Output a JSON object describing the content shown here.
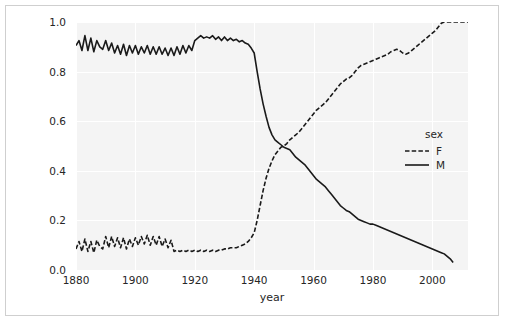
{
  "chart_data": {
    "type": "line",
    "title": "",
    "xlabel": "year",
    "ylabel": "",
    "xlim": [
      1880,
      2012
    ],
    "ylim": [
      0.0,
      1.0
    ],
    "grid": true,
    "legend_title": "sex",
    "legend_position": "right",
    "xticks": [
      1880,
      1900,
      1920,
      1940,
      1960,
      1980,
      2000
    ],
    "xtick_labels": [
      "1880",
      "1900",
      "1920",
      "1940",
      "1960",
      "1980",
      "2000"
    ],
    "yticks": [
      0.0,
      0.2,
      0.4,
      0.6,
      0.8,
      1.0
    ],
    "ytick_labels": [
      "0.0",
      "0.2",
      "0.4",
      "0.6",
      "0.8",
      "1.0"
    ],
    "series": [
      {
        "name": "F",
        "linestyle": "dashed",
        "color": "#1a1a1a",
        "x": [
          1880,
          1881,
          1882,
          1883,
          1884,
          1885,
          1886,
          1887,
          1888,
          1889,
          1890,
          1891,
          1892,
          1893,
          1894,
          1895,
          1896,
          1897,
          1898,
          1899,
          1900,
          1901,
          1902,
          1903,
          1904,
          1905,
          1906,
          1907,
          1908,
          1909,
          1910,
          1911,
          1912,
          1913,
          1914,
          1915,
          1916,
          1917,
          1918,
          1919,
          1920,
          1921,
          1922,
          1923,
          1924,
          1925,
          1926,
          1927,
          1928,
          1929,
          1930,
          1931,
          1932,
          1933,
          1934,
          1935,
          1936,
          1937,
          1938,
          1939,
          1940,
          1941,
          1942,
          1943,
          1944,
          1945,
          1946,
          1947,
          1948,
          1949,
          1950,
          1951,
          1952,
          1953,
          1954,
          1955,
          1956,
          1957,
          1958,
          1959,
          1960,
          1961,
          1962,
          1963,
          1964,
          1965,
          1966,
          1967,
          1968,
          1969,
          1970,
          1971,
          1972,
          1973,
          1974,
          1975,
          1976,
          1977,
          1978,
          1979,
          1980,
          1981,
          1982,
          1983,
          1984,
          1985,
          1986,
          1987,
          1988,
          1989,
          1990,
          1991,
          1992,
          1993,
          1994,
          1995,
          1996,
          1997,
          1998,
          1999,
          2000,
          2001,
          2002,
          2003,
          2004,
          2005,
          2006,
          2007,
          2008,
          2009,
          2010,
          2011,
          2012
        ],
        "values": [
          0.085,
          0.115,
          0.075,
          0.125,
          0.075,
          0.115,
          0.07,
          0.12,
          0.095,
          0.085,
          0.135,
          0.09,
          0.135,
          0.095,
          0.13,
          0.09,
          0.13,
          0.085,
          0.125,
          0.095,
          0.13,
          0.1,
          0.135,
          0.105,
          0.14,
          0.1,
          0.135,
          0.1,
          0.135,
          0.095,
          0.125,
          0.09,
          0.12,
          0.075,
          0.08,
          0.075,
          0.08,
          0.075,
          0.08,
          0.075,
          0.08,
          0.075,
          0.08,
          0.075,
          0.08,
          0.075,
          0.08,
          0.075,
          0.08,
          0.08,
          0.085,
          0.085,
          0.09,
          0.09,
          0.09,
          0.095,
          0.1,
          0.105,
          0.115,
          0.13,
          0.15,
          0.2,
          0.26,
          0.32,
          0.37,
          0.41,
          0.44,
          0.465,
          0.48,
          0.495,
          0.5,
          0.51,
          0.525,
          0.535,
          0.545,
          0.555,
          0.57,
          0.585,
          0.6,
          0.615,
          0.63,
          0.645,
          0.655,
          0.665,
          0.675,
          0.69,
          0.705,
          0.72,
          0.735,
          0.75,
          0.76,
          0.77,
          0.775,
          0.785,
          0.8,
          0.815,
          0.825,
          0.83,
          0.835,
          0.84,
          0.845,
          0.85,
          0.855,
          0.86,
          0.865,
          0.87,
          0.88,
          0.885,
          0.89,
          0.885,
          0.875,
          0.87,
          0.875,
          0.885,
          0.895,
          0.905,
          0.915,
          0.925,
          0.935,
          0.945,
          0.955,
          0.965,
          0.98,
          0.995,
          1.0,
          1.0,
          1.0,
          1.0,
          1.0,
          1.0,
          1.0,
          1.0,
          1.0
        ]
      },
      {
        "name": "M",
        "linestyle": "solid",
        "color": "#1a1a1a",
        "x": [
          1880,
          1881,
          1882,
          1883,
          1884,
          1885,
          1886,
          1887,
          1888,
          1889,
          1890,
          1891,
          1892,
          1893,
          1894,
          1895,
          1896,
          1897,
          1898,
          1899,
          1900,
          1901,
          1902,
          1903,
          1904,
          1905,
          1906,
          1907,
          1908,
          1909,
          1910,
          1911,
          1912,
          1913,
          1914,
          1915,
          1916,
          1917,
          1918,
          1919,
          1920,
          1921,
          1922,
          1923,
          1924,
          1925,
          1926,
          1927,
          1928,
          1929,
          1930,
          1931,
          1932,
          1933,
          1934,
          1935,
          1936,
          1937,
          1938,
          1939,
          1940,
          1941,
          1942,
          1943,
          1944,
          1945,
          1946,
          1947,
          1948,
          1949,
          1950,
          1951,
          1952,
          1953,
          1954,
          1955,
          1956,
          1957,
          1958,
          1959,
          1960,
          1961,
          1962,
          1963,
          1964,
          1965,
          1966,
          1967,
          1968,
          1969,
          1970,
          1971,
          1972,
          1973,
          1974,
          1975,
          1976,
          1977,
          1978,
          1979,
          1980,
          1981,
          1982,
          1983,
          1984,
          1985,
          1986,
          1987,
          1988,
          1989,
          1990,
          1991,
          1992,
          1993,
          1994,
          1995,
          1996,
          1997,
          1998,
          1999,
          2000,
          2001,
          2002,
          2003,
          2004,
          2005,
          2006,
          2007
        ],
        "values": [
          0.905,
          0.925,
          0.885,
          0.945,
          0.885,
          0.935,
          0.88,
          0.925,
          0.9,
          0.89,
          0.925,
          0.885,
          0.915,
          0.875,
          0.905,
          0.87,
          0.91,
          0.865,
          0.905,
          0.875,
          0.905,
          0.87,
          0.9,
          0.875,
          0.905,
          0.87,
          0.9,
          0.87,
          0.9,
          0.87,
          0.895,
          0.865,
          0.895,
          0.865,
          0.9,
          0.87,
          0.905,
          0.875,
          0.905,
          0.885,
          0.925,
          0.935,
          0.945,
          0.935,
          0.94,
          0.935,
          0.945,
          0.93,
          0.94,
          0.925,
          0.94,
          0.925,
          0.935,
          0.925,
          0.93,
          0.92,
          0.925,
          0.915,
          0.91,
          0.895,
          0.875,
          0.8,
          0.73,
          0.67,
          0.62,
          0.575,
          0.545,
          0.525,
          0.515,
          0.505,
          0.495,
          0.49,
          0.485,
          0.47,
          0.455,
          0.445,
          0.435,
          0.425,
          0.41,
          0.395,
          0.38,
          0.365,
          0.355,
          0.345,
          0.335,
          0.32,
          0.305,
          0.29,
          0.275,
          0.26,
          0.25,
          0.24,
          0.235,
          0.225,
          0.215,
          0.205,
          0.2,
          0.195,
          0.19,
          0.185,
          0.185,
          0.18,
          0.175,
          0.17,
          0.165,
          0.16,
          0.155,
          0.15,
          0.145,
          0.14,
          0.135,
          0.13,
          0.125,
          0.12,
          0.115,
          0.11,
          0.105,
          0.1,
          0.095,
          0.09,
          0.085,
          0.08,
          0.075,
          0.07,
          0.065,
          0.055,
          0.045,
          0.03
        ]
      }
    ]
  }
}
